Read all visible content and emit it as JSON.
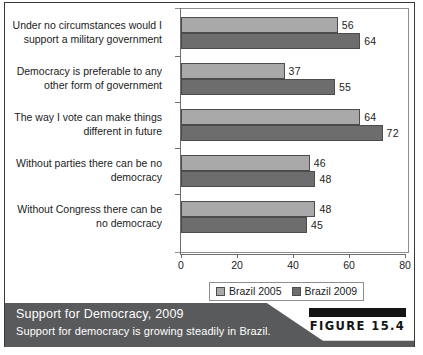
{
  "chart_data": {
    "type": "bar",
    "orientation": "horizontal",
    "title": "Support for Democracy, 2009",
    "subtitle": "Support for democracy is growing steadily in Brazil.",
    "xlabel": "",
    "ylabel": "",
    "xlim": [
      0,
      80
    ],
    "xticks": [
      0,
      20,
      40,
      60,
      80
    ],
    "grid": false,
    "legend_position": "bottom",
    "categories": [
      "Under no circumstances would I support a military government",
      "Democracy is preferable to any other form of government",
      "The way I vote can make things different in future",
      "Without parties there can be no democracy",
      "Without Congress there can be no democracy"
    ],
    "category_lines": [
      [
        "Under no circumstances would I",
        "support a military government"
      ],
      [
        "Democracy is preferable to any",
        "other form of government"
      ],
      [
        "The way I vote can make things",
        "different in future"
      ],
      [
        "Without parties there can be no",
        "democracy"
      ],
      [
        "Without Congress there can be",
        "no democracy"
      ]
    ],
    "series": [
      {
        "name": "Brazil 2005",
        "color": "#a9a9a9",
        "values": [
          56,
          37,
          64,
          46,
          48
        ]
      },
      {
        "name": "Brazil 2009",
        "color": "#6d6d6d",
        "values": [
          64,
          55,
          72,
          48,
          45
        ]
      }
    ]
  },
  "figure": {
    "number_label": "FIGURE 15.4"
  }
}
